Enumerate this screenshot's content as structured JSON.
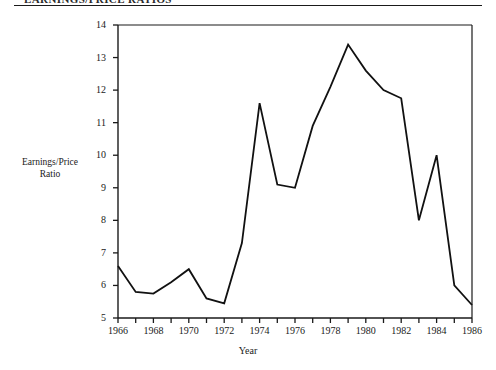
{
  "figure": {
    "clipped_header_text": "EARNINGS/PRICE RATIOS",
    "xlabel": "Year",
    "ylabel_line1": "Earnings/Price",
    "ylabel_line2": "Ratio",
    "line_color": "#111111",
    "axis_color": "#1a1a1a",
    "background_color": "#ffffff"
  },
  "chart_data": {
    "type": "line",
    "title": "",
    "xlabel": "Year",
    "ylabel": "Earnings/Price Ratio",
    "xlim": [
      1966,
      1986
    ],
    "ylim": [
      5,
      14
    ],
    "grid": false,
    "legend": "none",
    "y_ticks": [
      5,
      6,
      7,
      8,
      9,
      10,
      11,
      12,
      13,
      14
    ],
    "y_tick_labels": [
      "5",
      "6",
      "7",
      "8",
      "9",
      "10",
      "11",
      "12",
      "13",
      "14"
    ],
    "x_ticks": [
      1966,
      1967,
      1968,
      1969,
      1970,
      1971,
      1972,
      1973,
      1974,
      1975,
      1976,
      1977,
      1978,
      1979,
      1980,
      1981,
      1982,
      1983,
      1984,
      1985,
      1986
    ],
    "x_tick_labels": [
      "1966",
      "",
      "1968",
      "",
      "1970",
      "",
      "1972",
      "",
      "1974",
      "",
      "1976",
      "",
      "1978",
      "",
      "1980",
      "",
      "1982",
      "",
      "1984",
      "",
      "1986"
    ],
    "x_major_labels": [
      "1966",
      "1968",
      "1970",
      "1972",
      "1974",
      "1976",
      "1978",
      "1980",
      "1982",
      "1984",
      "1986"
    ],
    "x": [
      1966,
      1967,
      1968,
      1969,
      1970,
      1971,
      1972,
      1973,
      1974,
      1975,
      1976,
      1977,
      1978,
      1979,
      1980,
      1981,
      1982,
      1983,
      1984,
      1985,
      1986
    ],
    "values": [
      6.6,
      5.8,
      5.75,
      6.1,
      6.5,
      5.6,
      5.45,
      7.3,
      11.6,
      9.1,
      9.0,
      10.9,
      12.1,
      13.4,
      12.6,
      12.0,
      11.75,
      8.0,
      10.0,
      6.0,
      5.4
    ],
    "series": [
      {
        "name": "Earnings/Price Ratio",
        "values": [
          6.6,
          5.8,
          5.75,
          6.1,
          6.5,
          5.6,
          5.45,
          7.3,
          11.6,
          9.1,
          9.0,
          10.9,
          12.1,
          13.4,
          12.6,
          12.0,
          11.75,
          8.0,
          10.0,
          6.0,
          5.4
        ]
      }
    ]
  }
}
